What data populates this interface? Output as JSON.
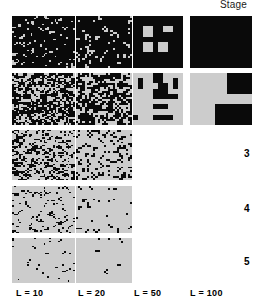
{
  "figure": {
    "header_label": "Stage",
    "background_color": "#ffffff",
    "cell_dark_color": "#0a0a0a",
    "cell_light_color": "#cccccc"
  },
  "columns": [
    {
      "label": "L = 10",
      "L": 10,
      "x": 12,
      "width": 63,
      "label_x": 16
    },
    {
      "label": "L = 20",
      "L": 20,
      "x": 76,
      "width": 56,
      "label_x": 78
    },
    {
      "label": "L = 50",
      "L": 50,
      "x": 133,
      "width": 50,
      "label_x": 134
    },
    {
      "label": "L = 100",
      "L": 100,
      "x": 190,
      "width": 62,
      "label_x": 190
    }
  ],
  "rows": [
    {
      "stage": "1",
      "y": 16,
      "height": 52,
      "label_y": 34
    },
    {
      "stage": "2",
      "y": 73,
      "height": 52,
      "label_y": 91
    },
    {
      "stage": "3",
      "y": 130,
      "height": 50,
      "label_y": 148
    },
    {
      "stage": "4",
      "y": 186,
      "height": 47,
      "label_y": 203
    },
    {
      "stage": "5",
      "y": 238,
      "height": 45,
      "label_y": 256
    }
  ],
  "chart_data": {
    "type": "heatmap",
    "title": "",
    "xlabel": "",
    "ylabel": "Stage",
    "row_variable": "Stage",
    "row_categories": [
      "1",
      "2",
      "3",
      "4",
      "5"
    ],
    "col_variable": "L",
    "col_categories": [
      "L = 10",
      "L = 20",
      "L = 50",
      "L = 100"
    ],
    "colors": {
      "occupied": "#0a0a0a",
      "empty": "#cccccc"
    },
    "legend": "none",
    "grid": false,
    "panels": [
      {
        "stage": "1",
        "L": 10,
        "grid_n": 34,
        "dark_fraction": 0.9,
        "pattern": "noise",
        "seed": 11,
        "present": true
      },
      {
        "stage": "1",
        "L": 20,
        "grid_n": 26,
        "dark_fraction": 0.88,
        "pattern": "noise",
        "seed": 12,
        "present": true
      },
      {
        "stage": "1",
        "L": 50,
        "grid_n": 10,
        "dark_fraction": 0.96,
        "pattern": "blocks",
        "seed": 13,
        "present": true,
        "blocks": [
          [
            2,
            2
          ],
          [
            3,
            2
          ],
          [
            2,
            3
          ],
          [
            3,
            3
          ],
          [
            6,
            2
          ],
          [
            7,
            2
          ],
          [
            2,
            5
          ],
          [
            3,
            5
          ],
          [
            2,
            6
          ],
          [
            3,
            6
          ],
          [
            5,
            5
          ],
          [
            6,
            5
          ],
          [
            5,
            6
          ],
          [
            6,
            6
          ]
        ]
      },
      {
        "stage": "1",
        "L": 100,
        "grid_n": 5,
        "dark_fraction": 1.0,
        "pattern": "solid-dark",
        "seed": 14,
        "present": true
      },
      {
        "stage": "2",
        "L": 10,
        "grid_n": 34,
        "dark_fraction": 0.6,
        "pattern": "noise",
        "seed": 21,
        "present": true
      },
      {
        "stage": "2",
        "L": 20,
        "grid_n": 26,
        "dark_fraction": 0.58,
        "pattern": "noise",
        "seed": 22,
        "present": true
      },
      {
        "stage": "2",
        "L": 50,
        "grid_n": 10,
        "dark_fraction": 0.32,
        "pattern": "blocks",
        "seed": 23,
        "present": true,
        "blocks": [
          [
            1,
            1
          ],
          [
            1,
            2
          ],
          [
            4,
            0
          ],
          [
            5,
            0
          ],
          [
            4,
            1
          ],
          [
            5,
            1
          ],
          [
            5,
            2
          ],
          [
            6,
            2
          ],
          [
            4,
            3
          ],
          [
            5,
            3
          ],
          [
            6,
            3
          ],
          [
            8,
            1
          ],
          [
            8,
            2
          ],
          [
            4,
            4
          ],
          [
            5,
            4
          ],
          [
            6,
            4
          ],
          [
            7,
            4
          ],
          [
            8,
            4
          ],
          [
            0,
            8
          ],
          [
            4,
            6
          ],
          [
            5,
            6
          ],
          [
            6,
            6
          ],
          [
            4,
            8
          ],
          [
            5,
            8
          ],
          [
            6,
            8
          ],
          [
            7,
            8
          ]
        ]
      },
      {
        "stage": "2",
        "L": 100,
        "grid_n": 5,
        "dark_fraction": 0.2,
        "pattern": "blocks",
        "seed": 24,
        "present": true,
        "blocks": [
          [
            3,
            0
          ],
          [
            4,
            0
          ],
          [
            3,
            1
          ],
          [
            4,
            1
          ],
          [
            2,
            3
          ],
          [
            3,
            3
          ],
          [
            4,
            3
          ],
          [
            2,
            4
          ],
          [
            3,
            4
          ],
          [
            4,
            4
          ]
        ]
      },
      {
        "stage": "3",
        "L": 10,
        "grid_n": 34,
        "dark_fraction": 0.34,
        "pattern": "noise",
        "seed": 31,
        "present": true
      },
      {
        "stage": "3",
        "L": 20,
        "grid_n": 26,
        "dark_fraction": 0.22,
        "pattern": "noise",
        "seed": 32,
        "present": true
      },
      {
        "stage": "3",
        "L": 50,
        "present": false
      },
      {
        "stage": "3",
        "L": 100,
        "present": false
      },
      {
        "stage": "4",
        "L": 10,
        "grid_n": 34,
        "dark_fraction": 0.12,
        "pattern": "noise",
        "seed": 41,
        "present": true
      },
      {
        "stage": "4",
        "L": 20,
        "grid_n": 26,
        "dark_fraction": 0.06,
        "pattern": "noise",
        "seed": 42,
        "present": true
      },
      {
        "stage": "4",
        "L": 50,
        "present": false
      },
      {
        "stage": "4",
        "L": 100,
        "present": false
      },
      {
        "stage": "5",
        "L": 10,
        "grid_n": 34,
        "dark_fraction": 0.03,
        "pattern": "noise",
        "seed": 51,
        "present": true
      },
      {
        "stage": "5",
        "L": 20,
        "grid_n": 26,
        "dark_fraction": 0.015,
        "pattern": "noise",
        "seed": 52,
        "present": true
      },
      {
        "stage": "5",
        "L": 50,
        "present": false
      },
      {
        "stage": "5",
        "L": 100,
        "present": false
      }
    ]
  }
}
